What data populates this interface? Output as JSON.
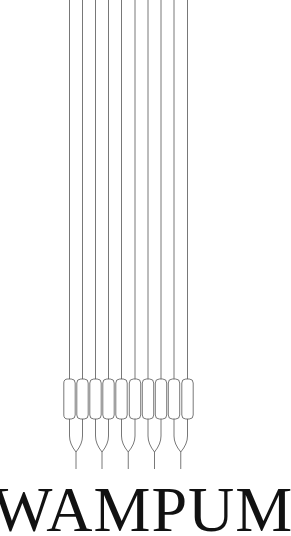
{
  "brand": {
    "wordmark": "WAMPUM"
  },
  "illustration": {
    "name": "wampum-strings-illustration",
    "strand_count": 10,
    "strand_x": [
      69.5,
      82.5,
      95.5,
      108.5,
      121.5,
      135,
      148,
      161,
      174,
      187.5
    ],
    "bead_top": 379,
    "bead_bottom": 419,
    "bead_width": 12,
    "fork_count": 5,
    "line_color": "#555555"
  },
  "colors": {
    "background": "#ffffff",
    "text": "#111111",
    "lines": "#555555"
  }
}
